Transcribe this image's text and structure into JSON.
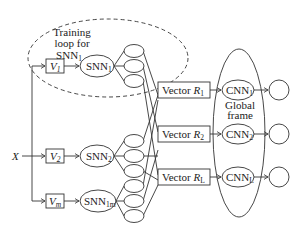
{
  "diagram": {
    "input_label": "X",
    "training_loop": {
      "line1": "Training",
      "line2": "loop for",
      "line3": "SNN",
      "line3_sub": "1"
    },
    "rows": [
      {
        "v_label": "V",
        "v_sub": "1",
        "snn_label": "SNN",
        "snn_sub": "1"
      },
      {
        "v_label": "V",
        "v_sub": "2",
        "snn_label": "SNN",
        "snn_sub": "2"
      },
      {
        "v_label": "V",
        "v_sub": "m",
        "snn_label": "SNN",
        "snn_sub": "1m"
      }
    ],
    "vectors": [
      {
        "label": "Vector ",
        "var": "R",
        "sub": "1"
      },
      {
        "label": "Vector ",
        "var": "R",
        "sub": "2"
      },
      {
        "label": "Vector ",
        "var": "R",
        "sub": "L"
      }
    ],
    "cnns": [
      {
        "label": "CNN",
        "sub": "1"
      },
      {
        "label": "CNN",
        "sub": "2"
      },
      {
        "label": "CNN",
        "sub": "L"
      }
    ],
    "global_frame": {
      "line1": "Global",
      "line2": "frame"
    }
  }
}
